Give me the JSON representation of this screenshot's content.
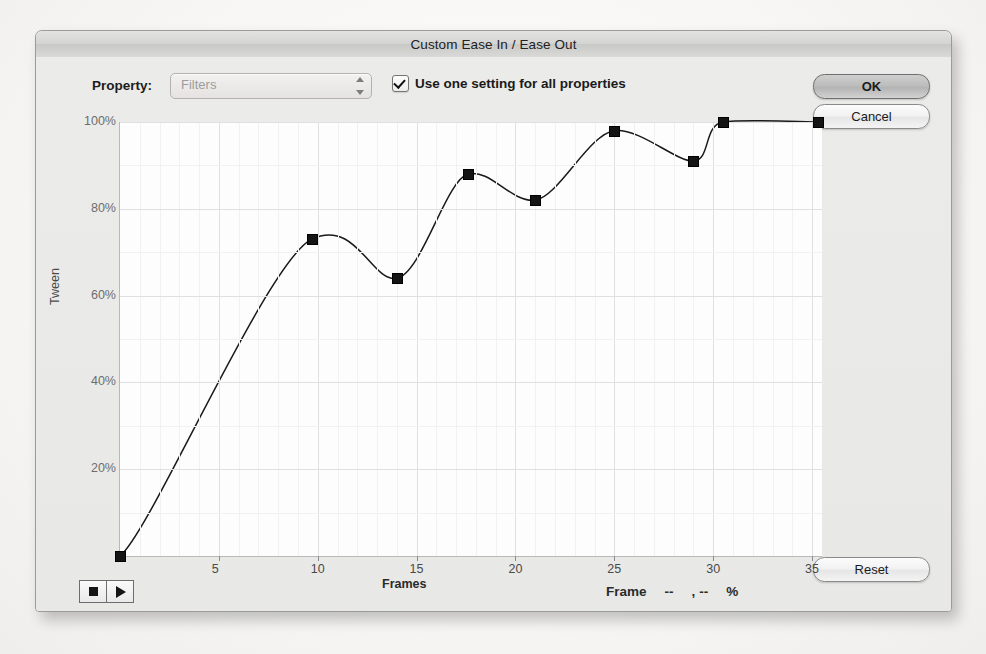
{
  "window": {
    "title": "Custom Ease In / Ease Out"
  },
  "controls": {
    "property_label": "Property:",
    "property_value": "Filters",
    "property_options": [
      "Filters"
    ],
    "use_one_setting_label": "Use one setting for all properties",
    "use_one_setting_checked": true
  },
  "buttons": {
    "ok": "OK",
    "cancel": "Cancel",
    "reset": "Reset"
  },
  "transport": {
    "stop_icon": "stop-square-icon",
    "play_icon": "play-triangle-icon"
  },
  "readout": {
    "label": "Frame",
    "frame_value": "--",
    "comma": ",",
    "percent_value": "--",
    "percent_sign": "%"
  },
  "chart_data": {
    "type": "line",
    "title": "",
    "xlabel": "Frames",
    "ylabel": "Tween",
    "xlim": [
      0,
      35.5
    ],
    "ylim": [
      0,
      100
    ],
    "xticks": [
      5,
      10,
      15,
      20,
      25,
      30,
      35
    ],
    "xticklabels": [
      "5",
      "10",
      "15",
      "20",
      "25",
      "30",
      "35"
    ],
    "yticks": [
      20,
      40,
      60,
      80,
      100
    ],
    "yticklabels": [
      "20%",
      "40%",
      "60%",
      "80%",
      "100%"
    ],
    "grid": true,
    "legend": "none",
    "line_color": "#1a1a1a",
    "point_color": "#141414",
    "series": [
      {
        "name": "Tween curve",
        "points": [
          {
            "frame": 0,
            "tween": 0
          },
          {
            "frame": 9.7,
            "tween": 73
          },
          {
            "frame": 14.0,
            "tween": 64
          },
          {
            "frame": 17.6,
            "tween": 88
          },
          {
            "frame": 21.0,
            "tween": 82
          },
          {
            "frame": 25.0,
            "tween": 98
          },
          {
            "frame": 29.0,
            "tween": 91
          },
          {
            "frame": 30.5,
            "tween": 100
          },
          {
            "frame": 35.3,
            "tween": 100
          }
        ]
      }
    ]
  }
}
